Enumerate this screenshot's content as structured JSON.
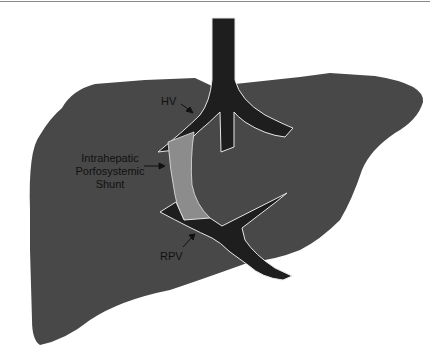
{
  "figure": {
    "type": "anatomical-diagram"
  },
  "labels": {
    "hv": "HV",
    "shunt_line1": "Intrahepatic",
    "shunt_line2": "Porfosystemic",
    "shunt_line3": "Shunt",
    "rpv": "RPV"
  },
  "colors": {
    "liver": "#484848",
    "vessel": "#1e1e1e",
    "shunt": "#8c8c8c",
    "outline": "#e6e6e6",
    "rule": "#8a8a8a"
  }
}
